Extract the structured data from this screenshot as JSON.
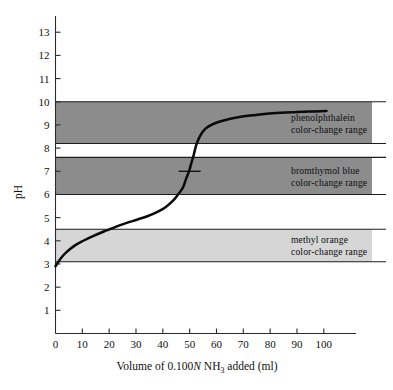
{
  "figure": {
    "background": "#ffffff",
    "curve_color": "#0a0a0a"
  },
  "axes": {
    "y_title": "pH",
    "x_title_parts": {
      "prefix": "Volume of 0.100",
      "normality_symbol": "N",
      "species": "NH",
      "species_subscript": "3",
      "suffix": "added  (ml)"
    },
    "x_title_full": "Volume of 0.100N NH3 added  (ml)",
    "y_ticks": [
      "1",
      "2",
      "3",
      "4",
      "5",
      "6",
      "7",
      "8",
      "9",
      "10",
      "11",
      "12",
      "13"
    ],
    "y_tick_values": [
      1,
      2,
      3,
      4,
      5,
      6,
      7,
      8,
      9,
      10,
      11,
      12,
      13
    ],
    "x_ticks": [
      "0",
      "10",
      "20",
      "30",
      "40",
      "50",
      "60",
      "70",
      "80",
      "90",
      "100"
    ],
    "x_tick_values": [
      0,
      10,
      20,
      30,
      40,
      50,
      60,
      70,
      80,
      90,
      100
    ],
    "ylim": [
      0,
      13.7
    ],
    "xlim": [
      0,
      112
    ]
  },
  "bands": [
    {
      "id": "phenolphthalein",
      "label_line1": "phenolphthalein",
      "label_line2": "color-change  range",
      "ph_low": 8.2,
      "ph_high": 10.0,
      "fill": "#8c8c8c"
    },
    {
      "id": "bromthymol-blue",
      "label_line1": "bromthymol  blue",
      "label_line2": "color-change  range",
      "ph_low": 6.0,
      "ph_high": 7.6,
      "fill": "#8c8c8c"
    },
    {
      "id": "methyl-orange",
      "label_line1": "methyl  orange",
      "label_line2": "color-change  range",
      "ph_low": 3.1,
      "ph_high": 4.5,
      "fill": "#d6d6d6"
    }
  ],
  "equivalence_point": {
    "volume_ml": 50,
    "ph": 7.0
  },
  "chart_data": {
    "type": "line",
    "title": "",
    "xlabel": "Volume of 0.100N NH3 added  (ml)",
    "ylabel": "pH",
    "xlim": [
      0,
      112
    ],
    "ylim": [
      0,
      13.7
    ],
    "grid": false,
    "legend": "none",
    "series": [
      {
        "name": "titration curve",
        "x": [
          0,
          2,
          4,
          7,
          10,
          14,
          18,
          22,
          26,
          30,
          34,
          38,
          41,
          44,
          46,
          47.5,
          48.5,
          49.5,
          50,
          50.5,
          51.5,
          52.5,
          54,
          56,
          59,
          63,
          68,
          74,
          81,
          89,
          96,
          101
        ],
        "y": [
          2.9,
          3.25,
          3.5,
          3.78,
          3.98,
          4.2,
          4.4,
          4.58,
          4.75,
          4.9,
          5.05,
          5.25,
          5.45,
          5.75,
          6.05,
          6.3,
          6.62,
          6.92,
          7.08,
          7.3,
          7.7,
          8.15,
          8.55,
          8.85,
          9.05,
          9.2,
          9.33,
          9.42,
          9.5,
          9.55,
          9.58,
          9.6
        ]
      }
    ],
    "annotations": [
      {
        "type": "tick",
        "x": 50,
        "y": 7.0,
        "note": "equivalence point marker"
      },
      {
        "type": "band",
        "label": "phenolphthalein color-change range",
        "y_range": [
          8.2,
          10.0
        ]
      },
      {
        "type": "band",
        "label": "bromthymol blue color-change range",
        "y_range": [
          6.0,
          7.6
        ]
      },
      {
        "type": "band",
        "label": "methyl orange color-change range",
        "y_range": [
          3.1,
          4.5
        ]
      }
    ]
  }
}
